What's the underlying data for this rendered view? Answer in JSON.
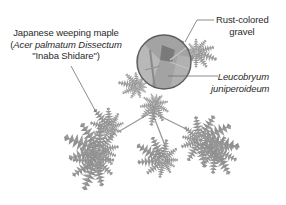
{
  "figure": {
    "type": "planting-diagram",
    "style": "grayscale-illustration",
    "background": "#ffffff",
    "foliage_color": "#8a8a8a",
    "circle_fill": "#a9a9a9",
    "circle_stroke": "#5a5a5a",
    "leader_color": "#7a7a7a"
  },
  "labels": {
    "maple": {
      "line1": "Japanese weeping maple",
      "line2_open": "(",
      "line2_italic": "Acer palmatum Dissectum",
      "line3": "\"Inaba Shidare\")"
    },
    "gravel": {
      "line1": "Rust-colored",
      "line2": "gravel"
    },
    "moss": {
      "line1": "Leucobryum",
      "line2": "juniperoideum"
    }
  },
  "elements": [
    {
      "name": "weeping-maple-foliage",
      "count": 5
    },
    {
      "name": "gravel-moss-circle",
      "shape": "circle"
    }
  ]
}
